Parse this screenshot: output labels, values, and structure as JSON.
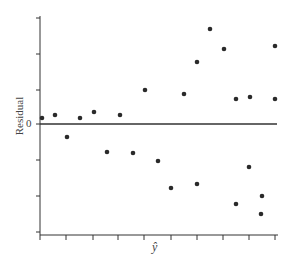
{
  "chart_data": {
    "type": "scatter",
    "title": "",
    "xlabel": "ŷ",
    "ylabel": "Residual",
    "y_tick_labels": [
      "0"
    ],
    "ylim": [
      -3.0,
      3.0
    ],
    "xlim": [
      0,
      9
    ],
    "grid": false,
    "reference_line": {
      "y": 0,
      "style": "solid"
    },
    "points": [
      {
        "x": 0.08,
        "y": 0.17
      },
      {
        "x": 0.58,
        "y": 0.25
      },
      {
        "x": 1.04,
        "y": -0.36
      },
      {
        "x": 1.54,
        "y": 0.17
      },
      {
        "x": 2.08,
        "y": 0.33
      },
      {
        "x": 2.58,
        "y": 0.25
      },
      {
        "x": 2.58,
        "y": -0.78
      },
      {
        "x": 3.58,
        "y": -0.81
      },
      {
        "x": 4.04,
        "y": 0.94
      },
      {
        "x": 4.54,
        "y": -1.03
      },
      {
        "x": 5.04,
        "y": 0.83
      },
      {
        "x": 5.04,
        "y": -1.78
      },
      {
        "x": 6.04,
        "y": 1.72
      },
      {
        "x": 6.04,
        "y": -1.67
      },
      {
        "x": 6.54,
        "y": 2.64
      },
      {
        "x": 7.08,
        "y": 2.08
      },
      {
        "x": 7.54,
        "y": 0.69
      },
      {
        "x": 7.54,
        "y": -2.22
      },
      {
        "x": 8.04,
        "y": 0.75
      },
      {
        "x": 8.04,
        "y": -1.19
      },
      {
        "x": 8.54,
        "y": -2.0
      },
      {
        "x": 8.5,
        "y": -2.5
      },
      {
        "x": 9.04,
        "y": 2.17
      },
      {
        "x": 9.04,
        "y": 0.69
      }
    ],
    "pixel_points": [
      [
        42,
        118
      ],
      [
        55,
        115
      ],
      [
        67,
        137
      ],
      [
        80,
        118
      ],
      [
        94,
        112
      ],
      [
        107,
        152
      ],
      [
        120,
        115
      ],
      [
        133,
        153
      ],
      [
        145,
        90
      ],
      [
        158,
        161
      ],
      [
        171,
        188
      ],
      [
        184,
        94
      ],
      [
        197,
        62
      ],
      [
        197,
        184
      ],
      [
        210,
        29
      ],
      [
        224,
        49
      ],
      [
        236,
        99
      ],
      [
        236,
        204
      ],
      [
        249,
        167
      ],
      [
        250,
        97
      ],
      [
        262,
        196
      ],
      [
        261,
        214
      ],
      [
        275,
        46
      ],
      [
        275,
        99
      ]
    ],
    "y_ticks_px": [
      18,
      54,
      90,
      124,
      160,
      196,
      232
    ],
    "x_ticks_px": [
      40,
      66,
      93,
      118,
      144,
      171,
      197,
      223,
      249,
      275
    ],
    "colors": {
      "axis": "#333333",
      "point": "#2a2a2a",
      "zero_line": "#333333"
    }
  }
}
